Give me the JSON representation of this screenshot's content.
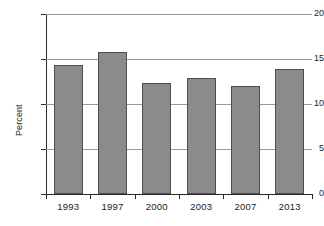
{
  "chart_data": {
    "type": "bar",
    "title": "",
    "xlabel": "",
    "ylabel": "Percent",
    "categories": [
      "1993",
      "1997",
      "2000",
      "2003",
      "2007",
      "2013"
    ],
    "values": [
      14.3,
      15.8,
      12.3,
      12.9,
      12.0,
      13.9
    ],
    "ylim": [
      0,
      20
    ],
    "ytick_labels": [
      "0",
      "5",
      "10",
      "15",
      "20"
    ],
    "ytick_values": [
      0,
      5,
      10,
      15,
      20
    ],
    "grid": "horizontal",
    "legend": "none",
    "series": [
      {
        "name": "Percent",
        "values": [
          14.3,
          15.8,
          12.3,
          12.9,
          12.0,
          13.9
        ]
      }
    ],
    "colors": {
      "bar_fill": "#8b8b8b",
      "bar_border": "#4e4e4e",
      "gridline": "#9a9a9a",
      "axis": "#2b2b2b",
      "text": "#1b1b1b",
      "background": "#ffffff"
    }
  }
}
